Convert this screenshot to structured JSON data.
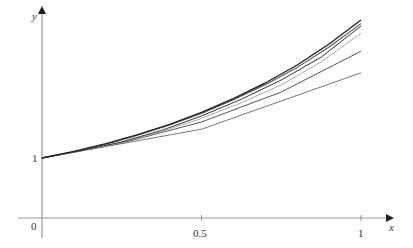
{
  "chart_data": {
    "type": "line",
    "title": "",
    "xlabel": "x",
    "ylabel": "y",
    "origin_label": "0",
    "x_ticks": [
      {
        "value": 0.5,
        "label": "0.5"
      },
      {
        "value": 1,
        "label": "1"
      }
    ],
    "y_ticks": [
      {
        "value": 1,
        "label": "1"
      }
    ],
    "xlim": [
      -0.14,
      1.2
    ],
    "ylim": [
      -0.33,
      3.45
    ],
    "grid": false,
    "legend": "none",
    "series": [
      {
        "name": "exact",
        "color": "#222222",
        "width": 1.4,
        "x": [
          0,
          0.1,
          0.2,
          0.3,
          0.4,
          0.5,
          0.6,
          0.7,
          0.8,
          0.9,
          1.0
        ],
        "y": [
          1,
          1.11,
          1.24,
          1.39,
          1.56,
          1.76,
          1.99,
          2.25,
          2.55,
          2.9,
          3.3
        ]
      },
      {
        "name": "approx-32",
        "color": "#555555",
        "width": 1.1,
        "x": [
          0,
          0.1,
          0.2,
          0.3,
          0.4,
          0.5,
          0.6,
          0.7,
          0.8,
          0.9,
          1.0
        ],
        "y": [
          1,
          1.105,
          1.23,
          1.38,
          1.55,
          1.74,
          1.97,
          2.22,
          2.51,
          2.85,
          3.24
        ]
      },
      {
        "name": "approx-16",
        "color": "#333333",
        "width": 1.0,
        "x": [
          0,
          0.125,
          0.25,
          0.375,
          0.5,
          0.625,
          0.75,
          0.875,
          1.0
        ],
        "y": [
          1,
          1.125,
          1.27,
          1.46,
          1.7,
          1.98,
          2.3,
          2.68,
          3.2
        ]
      },
      {
        "name": "approx-8",
        "color": "#aaaaaa",
        "width": 1.0,
        "x": [
          0,
          0.125,
          0.25,
          0.375,
          0.5,
          0.625,
          0.75,
          0.875,
          1.0
        ],
        "y": [
          1,
          1.12,
          1.26,
          1.44,
          1.66,
          1.92,
          2.22,
          2.6,
          3.08
        ]
      },
      {
        "name": "approx-4",
        "color": "#555555",
        "width": 1.0,
        "x": [
          0,
          0.25,
          0.5,
          0.75,
          1.0
        ],
        "y": [
          1,
          1.25,
          1.6,
          2.1,
          2.78
        ]
      },
      {
        "name": "approx-2",
        "color": "#777777",
        "width": 1.0,
        "x": [
          0,
          0.5,
          1.0
        ],
        "y": [
          1,
          1.48,
          2.42
        ]
      }
    ]
  },
  "axes": {
    "origin_px": {
      "x": 42,
      "y": 218
    },
    "unit_px": {
      "x": 319,
      "y": 60
    },
    "color": "#999999"
  }
}
